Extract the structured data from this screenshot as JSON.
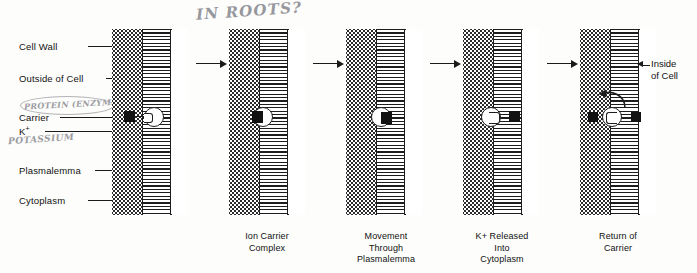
{
  "figure": {
    "title_handwritten": "IN ROOTS?"
  },
  "labels": {
    "cell_wall": "Cell Wall",
    "outside_of_cell": "Outside of Cell",
    "carrier": "Carrier",
    "potassium_ion": "K",
    "potassium_ion_charge": "+",
    "plasmalemma": "Plasmalemma",
    "cytoplasm": "Cytoplasm",
    "inside_of_cell_line1": "Inside",
    "inside_of_cell_line2": "of Cell"
  },
  "annotations": {
    "protein_enzyme": "PROTEIN (ENZYME)",
    "potassium": "POTASSIUM"
  },
  "panels": [
    {
      "id": "panel-1",
      "caption_lines": [],
      "state": "ion-outside-approaching-carrier"
    },
    {
      "id": "panel-2",
      "caption_lines": [
        "Ion Carrier",
        "Complex"
      ],
      "state": "ion-bound-to-carrier"
    },
    {
      "id": "panel-3",
      "caption_lines": [
        "Movement",
        "Through",
        "Plasmalemma"
      ],
      "state": "carrier-traversing-membrane"
    },
    {
      "id": "panel-4",
      "caption_lines": [
        "K+ Released",
        "Into",
        "Cytoplasm"
      ],
      "state": "ion-released-into-cytoplasm"
    },
    {
      "id": "panel-5",
      "caption_lines": [
        "Return of",
        "Carrier"
      ],
      "state": "carrier-returning"
    }
  ],
  "colors": {
    "ink": "#1d1d1d",
    "paper": "#fdfdfb",
    "ion_fill": "#121212",
    "handwriting": "#8c8c93",
    "membrane_fill": "#f4f4f4"
  }
}
